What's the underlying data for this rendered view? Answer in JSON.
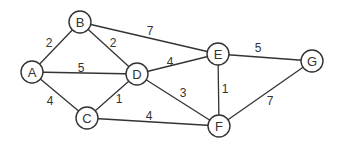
{
  "graph": {
    "nodes": [
      {
        "id": "A",
        "x": 32,
        "y": 72
      },
      {
        "id": "B",
        "x": 80,
        "y": 22
      },
      {
        "id": "C",
        "x": 87,
        "y": 118
      },
      {
        "id": "D",
        "x": 137,
        "y": 74
      },
      {
        "id": "E",
        "x": 218,
        "y": 54
      },
      {
        "id": "F",
        "x": 219,
        "y": 126
      },
      {
        "id": "G",
        "x": 312,
        "y": 61
      }
    ],
    "edges": [
      {
        "from": "A",
        "to": "B",
        "weight": "2",
        "lx": 49,
        "ly": 43
      },
      {
        "from": "A",
        "to": "D",
        "weight": "5",
        "lx": 81,
        "ly": 68
      },
      {
        "from": "A",
        "to": "C",
        "weight": "4",
        "lx": 50,
        "ly": 101
      },
      {
        "from": "B",
        "to": "D",
        "weight": "2",
        "lx": 113,
        "ly": 43
      },
      {
        "from": "B",
        "to": "E",
        "weight": "7",
        "lx": 150,
        "ly": 31
      },
      {
        "from": "C",
        "to": "D",
        "weight": "1",
        "lx": 119,
        "ly": 99
      },
      {
        "from": "C",
        "to": "F",
        "weight": "4",
        "lx": 149,
        "ly": 116
      },
      {
        "from": "D",
        "to": "E",
        "weight": "4",
        "lx": 170,
        "ly": 62
      },
      {
        "from": "D",
        "to": "F",
        "weight": "3",
        "lx": 183,
        "ly": 93
      },
      {
        "from": "E",
        "to": "F",
        "weight": "1",
        "lx": 225,
        "ly": 89
      },
      {
        "from": "E",
        "to": "G",
        "weight": "5",
        "lx": 258,
        "ly": 48
      },
      {
        "from": "F",
        "to": "G",
        "weight": "7",
        "lx": 270,
        "ly": 101
      }
    ]
  }
}
